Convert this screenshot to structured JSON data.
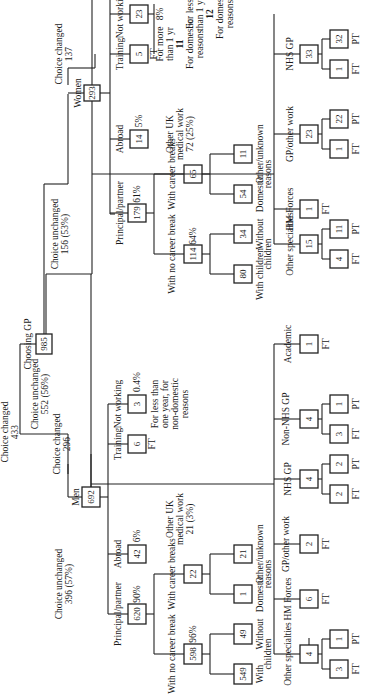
{
  "root": {
    "label": "Choosing GP",
    "value": "985"
  },
  "top_branches": {
    "women_changed": {
      "label": "Choice changed",
      "value": "433"
    },
    "women_unchanged": {
      "label": "Choice unchanged",
      "value": "156 (53%)"
    },
    "men_changed": {
      "label": "Choice changed",
      "value": "296"
    },
    "men_unchanged": {
      "label": "Choice unchanged",
      "value": "552 (56%)"
    }
  },
  "women": {
    "label": "Women",
    "value": "293",
    "choice_changed": {
      "label": "Choice changed",
      "value": "137"
    },
    "principal": {
      "label": "Principal/partner",
      "value": "179",
      "pct": "61%",
      "no_break": {
        "label": "With no career break",
        "value": "114",
        "pct": "64%",
        "with_children": {
          "label": "With children",
          "value": "80"
        },
        "without_children": {
          "label": "Without",
          "value": "34"
        },
        "children_label": "children"
      },
      "with_breaks": {
        "label": "With career breaks",
        "value": "65",
        "domestic": {
          "label": "Domestic",
          "value": "54"
        },
        "other": {
          "label": "Other/unknown",
          "value": "11"
        },
        "reasons_label": "reasons"
      }
    },
    "abroad": {
      "label": "Abroad",
      "value": "14",
      "pct": "5%"
    },
    "training": {
      "label": "Training",
      "value": "5",
      "sub": "FT"
    },
    "not_working": {
      "label": "Not working",
      "value": "23",
      "pct": "8%",
      "more_than_1yr": {
        "label_1": "For more",
        "label_2": "than 1 yr",
        "value": "11",
        "note_1": "For domestic",
        "note_2": "reasons"
      },
      "less_than_1yr": {
        "label_1": "For less",
        "label_2": "than 1 yr",
        "value": "12",
        "note_1": "For domestic",
        "note_2": "reasons"
      }
    },
    "other_uk": {
      "label_1": "Other UK",
      "label_2": "medical work",
      "label_3": "72 (25%)",
      "other_specialties": {
        "label_1": "Other",
        "label_2": "specialties",
        "value": "15",
        "ft": "4",
        "pt": "11"
      },
      "hm_forces": {
        "label": "HM Forces",
        "value": "1",
        "sub": "FT"
      },
      "gp_other": {
        "label": "GP/other work",
        "value": "23",
        "ft": "1",
        "pt": "22"
      },
      "nhs_gp": {
        "label": "NHS GP",
        "value": "33",
        "ft": "1",
        "pt": "32"
      }
    }
  },
  "men": {
    "label": "Men",
    "value": "692",
    "choice_unchanged": {
      "label": "Choice unchanged",
      "value": "396 (57%)"
    },
    "principal": {
      "label": "Principal/partner",
      "value": "620",
      "pct": "90%",
      "no_break": {
        "label": "With no career break",
        "value": "598",
        "pct": "96%",
        "with_children": {
          "label": "With",
          "value": "549"
        },
        "without_children": {
          "label": "Without",
          "value": "49"
        },
        "children_label": "children"
      },
      "with_breaks": {
        "label": "With career breaks",
        "value": "22",
        "domestic": {
          "label": "Domestic",
          "value": "1"
        },
        "other": {
          "label": "Other/unknown",
          "value": "21"
        },
        "reasons_label": "reasons"
      }
    },
    "abroad": {
      "label": "Abroad",
      "value": "42",
      "pct": "6%"
    },
    "training": {
      "label": "Training",
      "value": "6",
      "sub": "FT"
    },
    "not_working": {
      "label": "Not working",
      "value": "3",
      "pct": "0.4%",
      "note_1": "For less than",
      "note_2": "one year, for",
      "note_3": "non-domestic",
      "note_4": "reasons"
    },
    "other_uk": {
      "label_1": "Other UK",
      "label_2": "medical work",
      "label_3": "21 (3%)",
      "other_specialties": {
        "label_1": "Other",
        "label_2": "specialties",
        "value": "4",
        "ft": "3",
        "pt": "1"
      },
      "hm_forces": {
        "label": "HM Forces",
        "value": "6",
        "sub": "FT"
      },
      "gp_other": {
        "label_1": "GP/other",
        "label_2": "work",
        "value": "2",
        "sub": "FT"
      },
      "nhs_gp": {
        "label": "NHS GP",
        "value": "4",
        "ft": "2",
        "pt": "2"
      },
      "non_nhs_gp": {
        "label_1": "Non-NHS",
        "label_2": "GP",
        "value": "4",
        "ft": "3",
        "pt": "1"
      },
      "academic": {
        "label": "Academic",
        "value": "1",
        "sub": "FT"
      }
    }
  },
  "labels": {
    "ft": "FT",
    "pt": "PT"
  }
}
